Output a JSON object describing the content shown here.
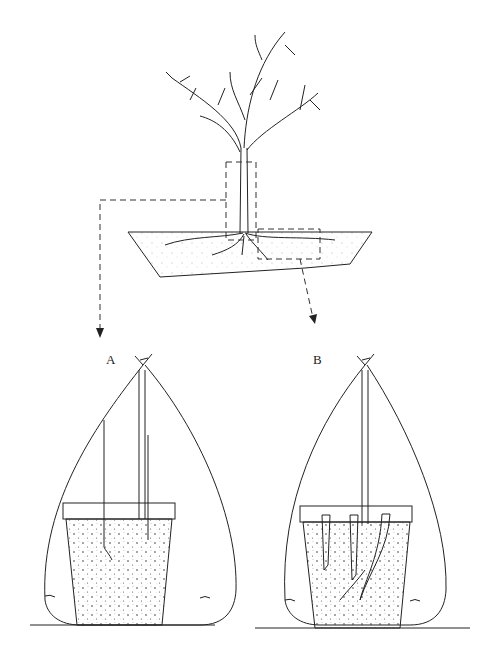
{
  "figure": {
    "labels": {
      "a": "A",
      "b": "B"
    },
    "panels": [
      {
        "id": "top",
        "description": "Tree with root system in soil bed, two dashed selection boxes (stem base and root section)"
      },
      {
        "id": "A",
        "description": "Stem cuttings in pot covered by plastic bag tied at top, water at base"
      },
      {
        "id": "B",
        "description": "Root cuttings in pot covered by plastic bag tied at top, water at base"
      }
    ],
    "colors": {
      "line": "#222222",
      "background": "#ffffff",
      "soil_dot": "#333333"
    }
  }
}
